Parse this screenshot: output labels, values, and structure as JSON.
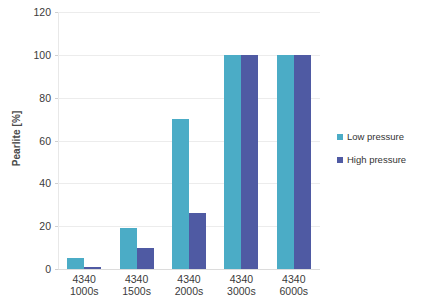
{
  "chart_data": {
    "type": "bar",
    "title": "",
    "subtitle": "",
    "xlabel": "",
    "ylabel": "Pearlite [%]",
    "ylim": [
      0,
      120
    ],
    "ytick_step": 20,
    "yticks": [
      0,
      20,
      40,
      60,
      80,
      100,
      120
    ],
    "ytick_labels": [
      "0",
      "20",
      "40",
      "60",
      "80",
      "100",
      "120"
    ],
    "grid": true,
    "grid_axis": "y",
    "legend_position": "right",
    "categories": [
      "4340 1000s",
      "4340 1500s",
      "4340 2000s",
      "4340 3000s",
      "4340 6000s"
    ],
    "category_lines": [
      {
        "line1": "4340",
        "line2": "1000s"
      },
      {
        "line1": "4340",
        "line2": "1500s"
      },
      {
        "line1": "4340",
        "line2": "2000s"
      },
      {
        "line1": "4340",
        "line2": "3000s"
      },
      {
        "line1": "4340",
        "line2": "6000s"
      }
    ],
    "series": [
      {
        "name": "Low pressure",
        "color": "#4bacc6",
        "values": [
          5,
          19,
          70,
          100,
          100
        ]
      },
      {
        "name": "High pressure",
        "color": "#4f5aa3",
        "values": [
          1,
          10,
          26,
          100,
          100
        ]
      }
    ]
  },
  "legend": {
    "items": [
      {
        "label": "Low pressure",
        "color": "#4bacc6"
      },
      {
        "label": "High pressure",
        "color": "#4f5aa3"
      }
    ]
  },
  "axes": {
    "y_title": "Pearlite [%]"
  },
  "colors": {
    "low_pressure": "#4bacc6",
    "high_pressure": "#4f5aa3",
    "gridline": "#ececec",
    "text": "#3a3a3a",
    "background": "#ffffff"
  }
}
